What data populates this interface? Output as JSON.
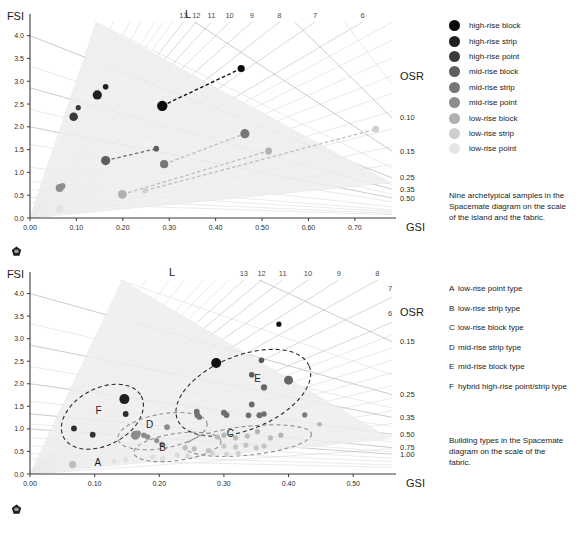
{
  "axes": {
    "y_title": "FSI",
    "x_title": "GSI",
    "osr_title": "OSR",
    "l_title": "L"
  },
  "chart_data": [
    {
      "id": "spacemate-island-fabric",
      "type": "scatter",
      "title": "Nine archetypical samples in the Spacemate diagram on the scale of the island and the fabric.",
      "xlabel": "GSI",
      "ylabel": "FSI",
      "xlim": [
        0.0,
        0.78
      ],
      "ylim": [
        0.0,
        4.3
      ],
      "xticks": [
        "0.00",
        "0.10",
        "0.20",
        "0.30",
        "0.40",
        "0.50",
        "0.60",
        "0.70"
      ],
      "xtickvals": [
        0.0,
        0.1,
        0.2,
        0.3,
        0.4,
        0.5,
        0.6,
        0.7
      ],
      "yticks": [
        "0.0",
        "0.5",
        "1.0",
        "1.5",
        "2.0",
        "2.5",
        "3.0",
        "3.5",
        "4.0"
      ],
      "ytickvals": [
        0.0,
        0.5,
        1.0,
        1.5,
        2.0,
        2.5,
        3.0,
        3.5,
        4.0
      ],
      "grid": true,
      "l_labels": [
        "13",
        "12",
        "11",
        "10",
        "9",
        "8",
        "7",
        "6"
      ],
      "l_values": [
        13,
        12,
        11,
        10,
        9,
        8,
        7,
        6
      ],
      "osr_labels": [
        "0.10",
        "0.15",
        "0.25",
        "0.35",
        "0.50"
      ],
      "osr_values": [
        0.1,
        0.15,
        0.25,
        0.35,
        0.5
      ],
      "series": [
        {
          "name": "high-rise block",
          "color": "#0a0a0a",
          "points": [
            {
              "x": 0.285,
              "y": 2.46,
              "r": 5.2
            },
            {
              "x": 0.455,
              "y": 3.28,
              "r": 3.6
            }
          ],
          "connector": "dark"
        },
        {
          "name": "high-rise strip",
          "color": "#1f1f1f",
          "points": [
            {
              "x": 0.145,
              "y": 2.7,
              "r": 4.6
            },
            {
              "x": 0.163,
              "y": 2.88,
              "r": 2.8
            }
          ]
        },
        {
          "name": "high-rise point",
          "color": "#3a3a3a",
          "points": [
            {
              "x": 0.094,
              "y": 2.22,
              "r": 4.3
            },
            {
              "x": 0.104,
              "y": 2.42,
              "r": 2.6
            }
          ]
        },
        {
          "name": "mid-rise block",
          "color": "#5e5e5e",
          "points": [
            {
              "x": 0.163,
              "y": 1.26,
              "r": 4.6
            },
            {
              "x": 0.272,
              "y": 1.52,
              "r": 2.9
            }
          ],
          "connector": "mid"
        },
        {
          "name": "mid-rise strip",
          "color": "#767676",
          "points": [
            {
              "x": 0.289,
              "y": 1.18,
              "r": 4.1
            },
            {
              "x": 0.463,
              "y": 1.85,
              "r": 4.6
            }
          ]
        },
        {
          "name": "mid-rise point",
          "color": "#8d8d8d",
          "points": [
            {
              "x": 0.064,
              "y": 0.66,
              "r": 4.0
            },
            {
              "x": 0.07,
              "y": 0.7,
              "r": 3.0
            }
          ]
        },
        {
          "name": "low-rise block",
          "color": "#b0b0b0",
          "points": [
            {
              "x": 0.199,
              "y": 0.52,
              "r": 4.4
            },
            {
              "x": 0.514,
              "y": 1.47,
              "r": 3.4
            }
          ],
          "connector": "lite"
        },
        {
          "name": "low-rise strip",
          "color": "#cfcfcf",
          "points": [
            {
              "x": 0.248,
              "y": 0.6,
              "r": 2.7
            },
            {
              "x": 0.745,
              "y": 1.95,
              "r": 3.4
            }
          ]
        },
        {
          "name": "low-rise point",
          "color": "#e3e3e3",
          "points": [
            {
              "x": 0.064,
              "y": 0.2,
              "r": 3.8
            }
          ]
        }
      ]
    },
    {
      "id": "spacemate-fabric-types",
      "type": "scatter",
      "title": "Building types in the Spacemate diagram on the scale of the fabric.",
      "xlabel": "GSI",
      "ylabel": "FSI",
      "xlim": [
        0.0,
        0.56
      ],
      "ylim": [
        0.0,
        4.3
      ],
      "xticks": [
        "0.00",
        "0.10",
        "0.20",
        "0.30",
        "0.40",
        "0.50"
      ],
      "xtickvals": [
        0.0,
        0.1,
        0.2,
        0.3,
        0.4,
        0.5
      ],
      "yticks": [
        "0.0",
        "0.5",
        "1.0",
        "1.5",
        "2.0",
        "2.5",
        "3.0",
        "3.5",
        "4.0"
      ],
      "ytickvals": [
        0.0,
        0.5,
        1.0,
        1.5,
        2.0,
        2.5,
        3.0,
        3.5,
        4.0
      ],
      "grid": true,
      "l_labels": [
        "13",
        "12",
        "11",
        "10",
        "9",
        "8",
        "7",
        "6"
      ],
      "l_values": [
        13,
        12,
        11,
        10,
        9,
        8,
        7,
        6
      ],
      "osr_labels": [
        "0.15",
        "0.25",
        "0.35",
        "0.50",
        "0.75",
        "1.00"
      ],
      "osr_values": [
        0.15,
        0.25,
        0.35,
        0.5,
        0.75,
        1.0
      ],
      "clusters": [
        {
          "label": "A",
          "lx": 0.105,
          "ly": 0.18
        },
        {
          "label": "B",
          "lx": 0.205,
          "ly": 0.5
        },
        {
          "label": "C",
          "lx": 0.31,
          "ly": 0.82
        },
        {
          "label": "D",
          "lx": 0.185,
          "ly": 1.02
        },
        {
          "label": "E",
          "lx": 0.352,
          "ly": 2.05
        },
        {
          "label": "F",
          "lx": 0.106,
          "ly": 1.33
        }
      ],
      "points": [
        {
          "x": 0.385,
          "y": 3.32,
          "r": 2.6,
          "color": "#111111"
        },
        {
          "x": 0.288,
          "y": 2.46,
          "r": 5.0,
          "color": "#111111"
        },
        {
          "x": 0.146,
          "y": 1.66,
          "r": 5.0,
          "color": "#1f1f1f"
        },
        {
          "x": 0.148,
          "y": 1.33,
          "r": 2.9,
          "color": "#2b2b2b"
        },
        {
          "x": 0.068,
          "y": 1.01,
          "r": 2.9,
          "color": "#2b2b2b"
        },
        {
          "x": 0.097,
          "y": 0.87,
          "r": 2.9,
          "color": "#333333"
        },
        {
          "x": 0.358,
          "y": 2.52,
          "r": 2.8,
          "color": "#5a5a5a"
        },
        {
          "x": 0.343,
          "y": 2.2,
          "r": 2.8,
          "color": "#5e5e5e"
        },
        {
          "x": 0.4,
          "y": 2.08,
          "r": 4.5,
          "color": "#666666"
        },
        {
          "x": 0.362,
          "y": 1.92,
          "r": 3.1,
          "color": "#666666"
        },
        {
          "x": 0.343,
          "y": 1.54,
          "r": 2.9,
          "color": "#6b6b6b"
        },
        {
          "x": 0.3,
          "y": 1.36,
          "r": 3.0,
          "color": "#6e6e6e"
        },
        {
          "x": 0.304,
          "y": 1.31,
          "r": 3.0,
          "color": "#6e6e6e"
        },
        {
          "x": 0.338,
          "y": 1.3,
          "r": 2.8,
          "color": "#6e6e6e"
        },
        {
          "x": 0.258,
          "y": 1.38,
          "r": 2.9,
          "color": "#707070"
        },
        {
          "x": 0.259,
          "y": 1.3,
          "r": 2.9,
          "color": "#707070"
        },
        {
          "x": 0.262,
          "y": 1.26,
          "r": 2.7,
          "color": "#747474"
        },
        {
          "x": 0.355,
          "y": 1.3,
          "r": 3.0,
          "color": "#707070"
        },
        {
          "x": 0.362,
          "y": 1.33,
          "r": 2.7,
          "color": "#707070"
        },
        {
          "x": 0.425,
          "y": 1.31,
          "r": 2.6,
          "color": "#7a7a7a"
        },
        {
          "x": 0.448,
          "y": 1.1,
          "r": 2.4,
          "color": "#b5b5b5"
        },
        {
          "x": 0.212,
          "y": 1.04,
          "r": 2.9,
          "color": "#8a8a8a"
        },
        {
          "x": 0.163,
          "y": 0.86,
          "r": 4.5,
          "color": "#8d8d8d"
        },
        {
          "x": 0.167,
          "y": 0.9,
          "r": 3.0,
          "color": "#8d8d8d"
        },
        {
          "x": 0.176,
          "y": 0.86,
          "r": 2.7,
          "color": "#8d8d8d"
        },
        {
          "x": 0.182,
          "y": 0.82,
          "r": 2.7,
          "color": "#8d8d8d"
        },
        {
          "x": 0.196,
          "y": 0.74,
          "r": 2.6,
          "color": "#949494"
        },
        {
          "x": 0.204,
          "y": 0.66,
          "r": 2.6,
          "color": "#9a9a9a"
        },
        {
          "x": 0.24,
          "y": 0.58,
          "r": 2.6,
          "color": "#bdbdbd"
        },
        {
          "x": 0.254,
          "y": 0.56,
          "r": 2.6,
          "color": "#bdbdbd"
        },
        {
          "x": 0.276,
          "y": 0.52,
          "r": 2.6,
          "color": "#c4c4c4"
        },
        {
          "x": 0.29,
          "y": 0.82,
          "r": 2.6,
          "color": "#b8b8b8"
        },
        {
          "x": 0.3,
          "y": 0.86,
          "r": 2.6,
          "color": "#b8b8b8"
        },
        {
          "x": 0.318,
          "y": 0.8,
          "r": 2.6,
          "color": "#bcbcbc"
        },
        {
          "x": 0.336,
          "y": 0.84,
          "r": 2.6,
          "color": "#bcbcbc"
        },
        {
          "x": 0.352,
          "y": 0.94,
          "r": 2.6,
          "color": "#b4b4b4"
        },
        {
          "x": 0.372,
          "y": 0.8,
          "r": 2.6,
          "color": "#bcbcbc"
        },
        {
          "x": 0.388,
          "y": 0.86,
          "r": 2.6,
          "color": "#b4b4b4"
        },
        {
          "x": 0.3,
          "y": 0.62,
          "r": 2.6,
          "color": "#c8c8c8"
        },
        {
          "x": 0.318,
          "y": 0.6,
          "r": 2.6,
          "color": "#c8c8c8"
        },
        {
          "x": 0.334,
          "y": 0.64,
          "r": 2.6,
          "color": "#c4c4c4"
        },
        {
          "x": 0.35,
          "y": 0.58,
          "r": 2.6,
          "color": "#c8c8c8"
        },
        {
          "x": 0.362,
          "y": 0.62,
          "r": 2.6,
          "color": "#c4c4c4"
        },
        {
          "x": 0.282,
          "y": 0.46,
          "r": 2.6,
          "color": "#d2d2d2"
        },
        {
          "x": 0.304,
          "y": 0.44,
          "r": 2.6,
          "color": "#d2d2d2"
        },
        {
          "x": 0.322,
          "y": 0.46,
          "r": 2.6,
          "color": "#d2d2d2"
        },
        {
          "x": 0.228,
          "y": 0.42,
          "r": 2.6,
          "color": "#dadada"
        },
        {
          "x": 0.244,
          "y": 0.4,
          "r": 2.6,
          "color": "#dadada"
        },
        {
          "x": 0.19,
          "y": 0.38,
          "r": 2.6,
          "color": "#dedede"
        },
        {
          "x": 0.205,
          "y": 0.34,
          "r": 2.6,
          "color": "#dedede"
        },
        {
          "x": 0.148,
          "y": 0.32,
          "r": 2.6,
          "color": "#e0e0e0"
        },
        {
          "x": 0.13,
          "y": 0.28,
          "r": 2.6,
          "color": "#e2e2e2"
        },
        {
          "x": 0.066,
          "y": 0.21,
          "r": 3.6,
          "color": "#bdbdbd"
        }
      ]
    }
  ],
  "legend": {
    "items": [
      {
        "label": "high-rise block",
        "color": "#0a0a0a"
      },
      {
        "label": "high-rise strip",
        "color": "#1f1f1f"
      },
      {
        "label": "high-rise point",
        "color": "#3a3a3a"
      },
      {
        "label": "mid-rise block",
        "color": "#5e5e5e"
      },
      {
        "label": "mid-rise strip",
        "color": "#767676"
      },
      {
        "label": "mid-rise point",
        "color": "#8d8d8d"
      },
      {
        "label": "low-rise block",
        "color": "#b0b0b0"
      },
      {
        "label": "low-rise strip",
        "color": "#cfcfcf"
      },
      {
        "label": "low-rise point",
        "color": "#e6e6e6"
      }
    ]
  },
  "type_key": {
    "items": [
      {
        "letter": "A",
        "name": "low-rise point type"
      },
      {
        "letter": "B",
        "name": "low-rise strip type"
      },
      {
        "letter": "C",
        "name": "low-rise block type"
      },
      {
        "letter": "D",
        "name": "mid-rise strip type"
      },
      {
        "letter": "E",
        "name": "mid-rise block type"
      },
      {
        "letter": "F",
        "name": "hybrid high-rise point/strip type"
      }
    ]
  },
  "captions": {
    "top": "Nine archetypical samples in the Spacemate diagram on the scale of the island and the fabric.",
    "bottom": "Building types in the Spacemate diagram on the scale of the fabric."
  }
}
